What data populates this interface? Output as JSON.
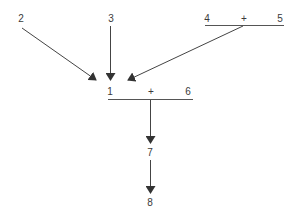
{
  "diagram": {
    "nodes": {
      "n1": "1",
      "n1_op": "+",
      "n6": "6",
      "n2": "2",
      "n3": "3",
      "n4": "4",
      "n45_op": "+",
      "n5": "5",
      "n7": "7",
      "n8": "8"
    },
    "edges": [
      {
        "from": "2",
        "to": "1"
      },
      {
        "from": "3",
        "to": "1"
      },
      {
        "from": "4+5",
        "to": "1"
      },
      {
        "from": "1+6",
        "to": "7"
      },
      {
        "from": "7",
        "to": "8"
      }
    ],
    "colors": {
      "line": "#444444",
      "text": "#3a3a3a",
      "background": "#ffffff"
    }
  }
}
